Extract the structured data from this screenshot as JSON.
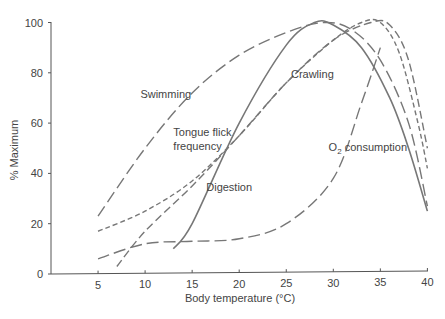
{
  "chart_data": {
    "type": "line",
    "title": "",
    "xlabel": "Body temperature (°C)",
    "ylabel": "% Maximum",
    "xlim": [
      0,
      40
    ],
    "ylim": [
      0,
      100
    ],
    "x_ticks": [
      5,
      10,
      15,
      20,
      25,
      30,
      35,
      40
    ],
    "y_ticks": [
      0,
      20,
      40,
      60,
      80,
      100
    ],
    "grid": false,
    "legend": "inline labels",
    "series": [
      {
        "name": "Swimming",
        "style": "long-dash",
        "points": [
          [
            5,
            23
          ],
          [
            10,
            50
          ],
          [
            15,
            72
          ],
          [
            20,
            87
          ],
          [
            25,
            96
          ],
          [
            29,
            100
          ],
          [
            32,
            97
          ],
          [
            35,
            85
          ],
          [
            38,
            60
          ],
          [
            40,
            27
          ]
        ]
      },
      {
        "name": "Tongue flick frequency",
        "style": "short-dash",
        "points": [
          [
            5,
            17
          ],
          [
            10,
            25
          ],
          [
            15,
            37
          ],
          [
            20,
            55
          ],
          [
            25,
            76
          ],
          [
            30,
            93
          ],
          [
            33,
            100
          ],
          [
            35,
            100
          ],
          [
            37,
            88
          ],
          [
            39,
            60
          ],
          [
            40,
            42
          ]
        ]
      },
      {
        "name": "Crawling",
        "style": "medium-dash",
        "points": [
          [
            7,
            3
          ],
          [
            10,
            17
          ],
          [
            15,
            35
          ],
          [
            20,
            55
          ],
          [
            25,
            76
          ],
          [
            30,
            93
          ],
          [
            34,
            100
          ],
          [
            36,
            99
          ],
          [
            38,
            85
          ],
          [
            40,
            50
          ]
        ]
      },
      {
        "name": "Digestion",
        "style": "solid",
        "points": [
          [
            13,
            10
          ],
          [
            15,
            20
          ],
          [
            20,
            60
          ],
          [
            25,
            91
          ],
          [
            28,
            100
          ],
          [
            30,
            99
          ],
          [
            33,
            90
          ],
          [
            36,
            70
          ],
          [
            38,
            50
          ],
          [
            40,
            25
          ]
        ]
      },
      {
        "name": "O2 consumption",
        "style": "long-dash",
        "points": [
          [
            5,
            6
          ],
          [
            10,
            12
          ],
          [
            15,
            13
          ],
          [
            20,
            14
          ],
          [
            25,
            20
          ],
          [
            30,
            38
          ],
          [
            33,
            68
          ],
          [
            35,
            90
          ]
        ]
      }
    ],
    "annotations": [
      {
        "text": "Swimming",
        "x": 9.5,
        "y": 70
      },
      {
        "text": "Tongue flick frequency",
        "x": 13,
        "y": 55
      },
      {
        "text": "Crawling",
        "x": 25.5,
        "y": 78
      },
      {
        "text": "Digestion",
        "x": 16.5,
        "y": 33
      },
      {
        "text": "O2 consumption",
        "x": 29.5,
        "y": 49
      }
    ]
  }
}
